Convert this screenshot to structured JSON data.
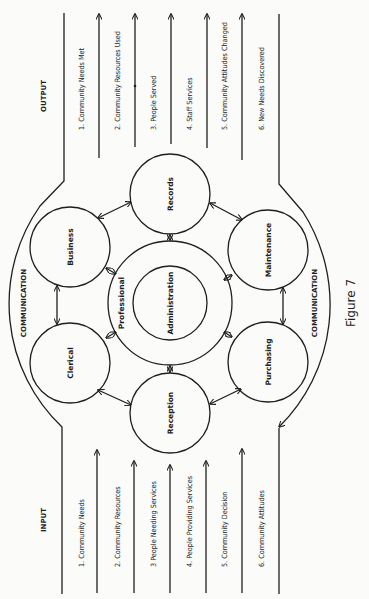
{
  "figure": {
    "caption": "Figure 7",
    "orientation": "rotated 90 degrees counter-clockwise"
  },
  "output": {
    "header": "OUTPUT",
    "items": [
      "1. Community Needs Met",
      "2. Community Resources Used",
      "3. People Served",
      "4. Staff Services",
      "5. Community Attitudes Changed",
      "6. New Needs Discovered"
    ]
  },
  "input": {
    "header": "INPUT",
    "items": [
      "1. Community Needs",
      "2. Community Resources",
      "3 People Needing Services",
      "4. People Providing Services",
      "5. Community Decision",
      "6. Community Attitudes"
    ]
  },
  "boundary": {
    "top_label": "COMMUNICATION",
    "bottom_label": "COMMUNICATION"
  },
  "nodes": {
    "center_inner": "Administration",
    "center_ring": "Professional",
    "records": "Records",
    "business": "Business",
    "clerical": "Clerical",
    "reception": "Reception",
    "purchasing": "Purchasing",
    "maintenance": "Maintenance"
  },
  "colors": {
    "ink": "#1e1e1e",
    "paper": "#fbfbf9"
  }
}
